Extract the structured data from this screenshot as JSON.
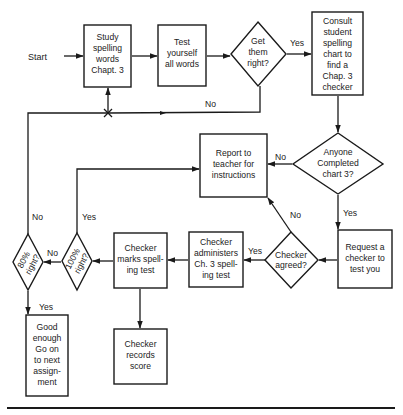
{
  "diagram": {
    "type": "flowchart",
    "start_label": "Start",
    "nodes": {
      "study": {
        "shape": "rect",
        "lines": [
          "Study",
          "spelling",
          "words",
          "Chapt. 3"
        ]
      },
      "test_yourself": {
        "shape": "rect",
        "lines": [
          "Test",
          "yourself",
          "all words"
        ]
      },
      "get_them_right": {
        "shape": "diamond",
        "lines": [
          "Get",
          "them",
          "right?"
        ]
      },
      "consult_chart": {
        "shape": "rect",
        "lines": [
          "Consult",
          "student",
          "spelling",
          "chart to",
          "find a",
          "Chap. 3",
          "checker"
        ]
      },
      "anyone_completed": {
        "shape": "diamond",
        "lines": [
          "Anyone",
          "Completed",
          "chart 3?"
        ]
      },
      "report_teacher": {
        "shape": "rect",
        "lines": [
          "Report to",
          "teacher for",
          "instructions"
        ]
      },
      "request_checker": {
        "shape": "rect",
        "lines": [
          "Request a",
          "checker to",
          "test you"
        ]
      },
      "checker_agreed": {
        "shape": "diamond",
        "lines": [
          "Checker",
          "agreed?"
        ]
      },
      "checker_administers": {
        "shape": "rect",
        "lines": [
          "Checker",
          "administers",
          "Ch. 3 spell-",
          "ing test"
        ]
      },
      "checker_marks": {
        "shape": "rect",
        "lines": [
          "Checker",
          "marks spell-",
          "ing test"
        ]
      },
      "hundred_right": {
        "shape": "diamond",
        "lines": [
          "100%",
          "right?"
        ]
      },
      "eighty_right": {
        "shape": "diamond",
        "lines": [
          "80%",
          "right?"
        ]
      },
      "good_enough": {
        "shape": "rect",
        "lines": [
          "Good",
          "enough",
          "Go on",
          "to next",
          "assign-",
          "ment"
        ]
      },
      "checker_records": {
        "shape": "rect",
        "lines": [
          "Checker",
          "records",
          "score"
        ]
      }
    },
    "edge_labels": {
      "get_right_yes": "Yes",
      "get_right_no": "No",
      "anyone_no": "No",
      "anyone_yes": "Yes",
      "agreed_yes": "Yes",
      "agreed_no": "No",
      "hundred_no": "No",
      "hundred_yes": "Yes",
      "eighty_no": "No",
      "eighty_yes": "Yes"
    },
    "edges": [
      {
        "from": "start",
        "to": "study"
      },
      {
        "from": "study",
        "to": "test_yourself"
      },
      {
        "from": "test_yourself",
        "to": "get_them_right"
      },
      {
        "from": "get_them_right",
        "to": "consult_chart",
        "label": "Yes"
      },
      {
        "from": "get_them_right",
        "to": "study",
        "label": "No"
      },
      {
        "from": "consult_chart",
        "to": "anyone_completed"
      },
      {
        "from": "anyone_completed",
        "to": "report_teacher",
        "label": "No"
      },
      {
        "from": "anyone_completed",
        "to": "request_checker",
        "label": "Yes"
      },
      {
        "from": "request_checker",
        "to": "checker_agreed"
      },
      {
        "from": "checker_agreed",
        "to": "checker_administers",
        "label": "Yes"
      },
      {
        "from": "checker_agreed",
        "to": "report_teacher",
        "label": "No"
      },
      {
        "from": "checker_administers",
        "to": "checker_marks"
      },
      {
        "from": "checker_marks",
        "to": "hundred_right"
      },
      {
        "from": "checker_marks",
        "to": "checker_records"
      },
      {
        "from": "hundred_right",
        "to": "report_teacher",
        "label": "Yes"
      },
      {
        "from": "hundred_right",
        "to": "eighty_right",
        "label": "No"
      },
      {
        "from": "eighty_right",
        "to": "good_enough",
        "label": "Yes"
      },
      {
        "from": "eighty_right",
        "to": "study",
        "label": "No"
      }
    ]
  }
}
